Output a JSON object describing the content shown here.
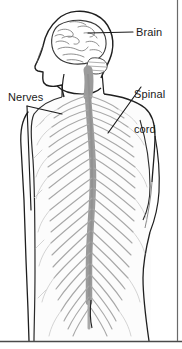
{
  "figure": {
    "background_color": "#ffffff",
    "border_color": "#4a4a4a",
    "outline_color": "#1f1f1f",
    "nerve_color": "#a8a8a8",
    "spinal_cord_color": "#9b9b9b",
    "brain_color": "#6f6f6f",
    "body_fill": "#fbfbfb",
    "label_color": "#1a1a1a"
  },
  "labels": {
    "brain": "Brain",
    "spinal_cord_line1": "Spinal",
    "spinal_cord_line2": "cord",
    "nerves": "Nerves"
  },
  "icons": {
    "brain": "brain-icon",
    "spinal_cord": "spinal-cord-icon",
    "nerves": "nerves-icon",
    "head": "head-profile-icon",
    "torso": "torso-icon"
  }
}
